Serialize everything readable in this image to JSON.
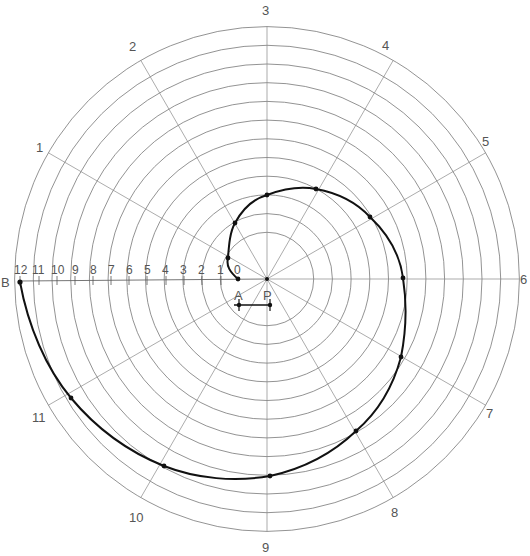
{
  "diagram": {
    "center": {
      "x": 267,
      "y": 279
    },
    "radial_labels": [
      "1",
      "2",
      "3",
      "4",
      "5",
      "6",
      "7",
      "8",
      "9",
      "10",
      "11",
      "12"
    ],
    "scale_labels": [
      "12",
      "11",
      "10",
      "9",
      "8",
      "7",
      "6",
      "5",
      "4",
      "3",
      "2",
      "1",
      "0"
    ],
    "point_labels": {
      "b": "B",
      "a": "A",
      "p": "P"
    },
    "spiral_points": [
      {
        "label": "0",
        "x": 238,
        "y": 279
      },
      {
        "label": "1",
        "x": 228,
        "y": 258
      },
      {
        "label": "2",
        "x": 235,
        "y": 223
      },
      {
        "label": "3",
        "x": 267,
        "y": 195
      },
      {
        "label": "4",
        "x": 316,
        "y": 189
      },
      {
        "label": "5",
        "x": 370,
        "y": 217
      },
      {
        "label": "6",
        "x": 403,
        "y": 278
      },
      {
        "label": "7",
        "x": 401,
        "y": 357
      },
      {
        "label": "8",
        "x": 356,
        "y": 431
      },
      {
        "label": "9",
        "x": 270,
        "y": 476
      },
      {
        "label": "10",
        "x": 164,
        "y": 466
      },
      {
        "label": "11",
        "x": 71,
        "y": 398
      },
      {
        "label": "12",
        "x": 20,
        "y": 282
      }
    ],
    "colors": {
      "curve": "#111111",
      "grid": "#777777",
      "text": "#555555"
    }
  }
}
